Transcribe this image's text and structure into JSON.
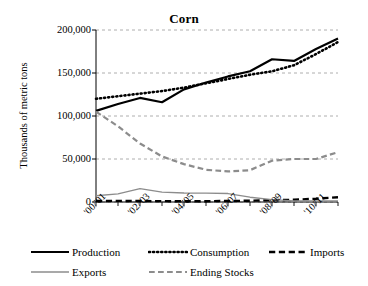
{
  "chart_data": {
    "type": "line",
    "title": "Corn",
    "xlabel": "",
    "ylabel": "Thousands of metric tons",
    "ylim": [
      0,
      200000
    ],
    "yticks": [
      0,
      50000,
      100000,
      150000,
      200000
    ],
    "ytick_labels": [
      "0",
      "50,000",
      "100,000",
      "150,000",
      "200,000"
    ],
    "grid": true,
    "legend_position": "bottom",
    "x": [
      "'00/'01",
      "'01/'02",
      "'02/'03",
      "'03/'04",
      "'04/'05",
      "'05/'06",
      "'06/'07",
      "'07/'08",
      "'08/'09",
      "'09/'10",
      "'10/'11",
      "'11/'12"
    ],
    "xtick_labels": [
      "'00/'01",
      "'02/'03",
      "'04/'05",
      "'06/'07",
      "'08/'09",
      "'10/'11"
    ],
    "xtick_indices": [
      0,
      2,
      4,
      6,
      8,
      10
    ],
    "series": [
      {
        "name": "Production",
        "style": "solid",
        "color": "#000000",
        "width": 2.2,
        "values": [
          106000,
          114000,
          121000,
          116000,
          131000,
          139000,
          146000,
          152000,
          166000,
          164000,
          178000,
          190000
        ]
      },
      {
        "name": "Consumption",
        "style": "dotted",
        "color": "#000000",
        "width": 2.6,
        "values": [
          120000,
          123000,
          126000,
          129000,
          133000,
          138000,
          143000,
          148000,
          152000,
          159000,
          172000,
          186000
        ]
      },
      {
        "name": "Imports",
        "style": "dashed",
        "color": "#000000",
        "width": 2.4,
        "values": [
          1200,
          1300,
          1100,
          1000,
          900,
          900,
          1200,
          1500,
          2200,
          2600,
          3800,
          5600
        ]
      },
      {
        "name": "Exports",
        "style": "solid",
        "color": "#8c8c8c",
        "width": 1.4,
        "values": [
          7300,
          9500,
          15500,
          11500,
          10500,
          10300,
          9800,
          5600,
          2800,
          1300,
          1200,
          1300
        ]
      },
      {
        "name": "Ending Stocks",
        "style": "dashed",
        "color": "#8c8c8c",
        "width": 2.2,
        "values": [
          105000,
          88000,
          68000,
          53000,
          44000,
          37500,
          35500,
          37000,
          48000,
          50000,
          50000,
          58000
        ]
      }
    ]
  },
  "legend": {
    "items": [
      {
        "label": "Production"
      },
      {
        "label": "Consumption"
      },
      {
        "label": "Imports"
      },
      {
        "label": "Exports"
      },
      {
        "label": "Ending Stocks"
      }
    ]
  }
}
